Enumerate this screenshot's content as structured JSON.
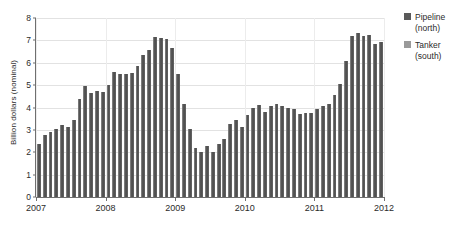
{
  "chart_data": {
    "type": "bar",
    "title": "",
    "xlabel": "",
    "ylabel": "Billion dollars (nominal)",
    "ylim": [
      0,
      8
    ],
    "yticks": [
      0,
      1,
      2,
      3,
      4,
      5,
      6,
      7,
      8
    ],
    "ytick_labels": [
      "0",
      "1",
      "2",
      "3",
      "4",
      "5",
      "6",
      "7",
      "8"
    ],
    "xtick_labels": [
      "2007",
      "2008",
      "2009",
      "2010",
      "2011",
      "2012"
    ],
    "grid": true,
    "legend_position": "right",
    "legend": [
      "Pipeline (north)",
      "Tanker (south)"
    ],
    "bar_color": "#5a5a5a",
    "categories": [
      "2007-01",
      "2007-02",
      "2007-03",
      "2007-04",
      "2007-05",
      "2007-06",
      "2007-07",
      "2007-08",
      "2007-09",
      "2007-10",
      "2007-11",
      "2007-12",
      "2008-01",
      "2008-02",
      "2008-03",
      "2008-04",
      "2008-05",
      "2008-06",
      "2008-07",
      "2008-08",
      "2008-09",
      "2008-10",
      "2008-11",
      "2008-12",
      "2009-01",
      "2009-02",
      "2009-03",
      "2009-04",
      "2009-05",
      "2009-06",
      "2009-07",
      "2009-08",
      "2009-09",
      "2009-10",
      "2009-11",
      "2009-12",
      "2010-01",
      "2010-02",
      "2010-03",
      "2010-04",
      "2010-05",
      "2010-06",
      "2010-07",
      "2010-08",
      "2010-09",
      "2010-10",
      "2010-11",
      "2010-12",
      "2011-01",
      "2011-02",
      "2011-03",
      "2011-04",
      "2011-05",
      "2011-06",
      "2011-07",
      "2011-08",
      "2011-09",
      "2011-10",
      "2011-11",
      "2011-12"
    ],
    "values": [
      2.35,
      2.75,
      2.9,
      3.05,
      3.2,
      3.15,
      3.45,
      4.4,
      4.95,
      4.65,
      4.75,
      4.7,
      5.0,
      5.6,
      5.5,
      5.5,
      5.55,
      5.85,
      6.35,
      6.55,
      7.15,
      7.1,
      7.05,
      6.65,
      5.5,
      4.15,
      3.05,
      2.2,
      2.0,
      2.3,
      2.0,
      2.35,
      2.6,
      3.25,
      3.45,
      3.15,
      3.65,
      4.0,
      4.1,
      3.8,
      4.05,
      4.15,
      4.05,
      4.0,
      3.95,
      3.7,
      3.75,
      3.75,
      3.95,
      4.05,
      4.15,
      4.55,
      5.05,
      6.1,
      7.2,
      7.35,
      7.2,
      7.25,
      6.85,
      6.95
    ]
  }
}
